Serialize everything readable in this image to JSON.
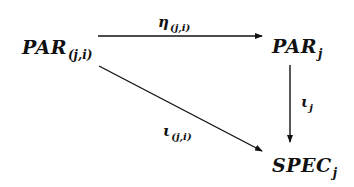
{
  "diagram": {
    "type": "commutative-triangle",
    "nodes": {
      "par_ji": {
        "main": "PAR",
        "sub": "(j,i)"
      },
      "par_j": {
        "main": "PAR",
        "sub": "j"
      },
      "spec_j": {
        "main": "SPEC",
        "sub": "j"
      }
    },
    "edges": {
      "eta": {
        "from": "PAR(j,i)",
        "to": "PARj",
        "main": "η",
        "sub": "(j,i)"
      },
      "iota_j": {
        "from": "PARj",
        "to": "SPECj",
        "main": "ι",
        "sub": "j"
      },
      "iota_ji": {
        "from": "PAR(j,i)",
        "to": "SPECj",
        "main": "ι",
        "sub": "(j,i)"
      }
    },
    "colors": {
      "ink": "#111111",
      "background": "#ffffff"
    }
  }
}
